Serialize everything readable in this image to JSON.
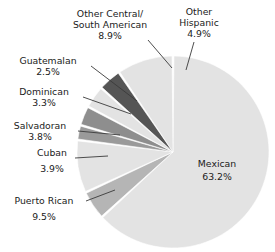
{
  "chart_data": {
    "type": "pie",
    "title": "",
    "xlabel": "",
    "ylabel": "",
    "units": "percent",
    "legend_position": "none",
    "labels_outside": true,
    "categories": [
      "Mexican",
      "Other Hispanic",
      "Other Central/South American",
      "Guatemalan",
      "Dominican",
      "Salvadoran",
      "Cuban",
      "Puerto Rican"
    ],
    "values": [
      63.2,
      4.9,
      8.9,
      2.5,
      3.3,
      3.8,
      3.9,
      9.5
    ],
    "value_texts": [
      "63.2%",
      "4.9%",
      "8.9%",
      "2.5%",
      "3.3%",
      "3.8%",
      "3.9%",
      "9.5%"
    ],
    "colors": [
      "#e3e3e3",
      "#b5b5b5",
      "#e3e3e3",
      "#9a9a9a",
      "#8e8e8e",
      "#e3e3e3",
      "#555555",
      "#e3e3e3"
    ],
    "slices": [
      {
        "name": "Mexican",
        "value": 63.2,
        "value_text": "63.2%",
        "label": "Mexican",
        "label_line2": "",
        "color": "#e3e3e3",
        "label_placement": "inside"
      },
      {
        "name": "Other Hispanic",
        "value": 4.9,
        "value_text": "4.9%",
        "label": "Other",
        "label_line2": "Hispanic",
        "color": "#b5b5b5",
        "label_placement": "outside"
      },
      {
        "name": "Other Central/South American",
        "value": 8.9,
        "value_text": "8.9%",
        "label": "Other Central/",
        "label_line2": "South American",
        "color": "#e3e3e3",
        "label_placement": "outside"
      },
      {
        "name": "Guatemalan",
        "value": 2.5,
        "value_text": "2.5%",
        "label": "Guatemalan",
        "label_line2": "",
        "color": "#9a9a9a",
        "label_placement": "outside"
      },
      {
        "name": "Dominican",
        "value": 3.3,
        "value_text": "3.3%",
        "label": "Dominican",
        "label_line2": "",
        "color": "#8e8e8e",
        "label_placement": "outside"
      },
      {
        "name": "Salvadoran",
        "value": 3.8,
        "value_text": "3.8%",
        "label": "Salvadoran",
        "label_line2": "",
        "color": "#e3e3e3",
        "label_placement": "outside"
      },
      {
        "name": "Cuban",
        "value": 3.9,
        "value_text": "3.9%",
        "label": "Cuban",
        "label_line2": "",
        "color": "#555555",
        "label_placement": "outside"
      },
      {
        "name": "Puerto Rican",
        "value": 9.5,
        "value_text": "9.5%",
        "label": "Puerto Rican",
        "label_line2": "",
        "color": "#e3e3e3",
        "label_placement": "outside"
      }
    ]
  },
  "labels": {
    "other_central_south_american_l1": "Other Central/",
    "other_central_south_american_l2": "South American",
    "other_central_south_american_pct": "8.9%",
    "other_hispanic_l1": "Other",
    "other_hispanic_l2": "Hispanic",
    "other_hispanic_pct": "4.9%",
    "guatemalan": "Guatemalan",
    "guatemalan_pct": "2.5%",
    "dominican": "Dominican",
    "dominican_pct": "3.3%",
    "salvadoran": "Salvadoran",
    "salvadoran_pct": "3.8%",
    "cuban": "Cuban",
    "cuban_pct": "3.9%",
    "puerto_rican": "Puerto Rican",
    "puerto_rican_pct": "9.5%",
    "mexican": "Mexican",
    "mexican_pct": "63.2%"
  },
  "style": {
    "background": "#ffffff",
    "light_gray": "#e3e3e3",
    "medium_gray": "#b5b5b5",
    "dark_gray": "#555555",
    "text_color": "#1b1b1b",
    "leader_color": "#3a3a3a"
  }
}
